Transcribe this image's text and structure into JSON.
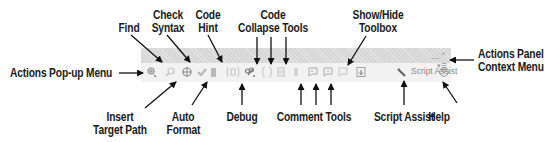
{
  "toolbar": {
    "buttons": [
      {
        "id": "actions-popup",
        "icon": "add-actions-icon",
        "glyph": "⊕"
      },
      {
        "id": "find",
        "icon": "find-icon",
        "glyph": "⌕"
      },
      {
        "id": "insert-target-path",
        "icon": "target-icon",
        "glyph": "⊕"
      },
      {
        "id": "check-syntax",
        "icon": "checkmark-icon",
        "glyph": "✔"
      },
      {
        "id": "auto-format",
        "icon": "auto-format-icon",
        "glyph": "▮"
      },
      {
        "id": "code-hint",
        "icon": "code-hint-icon",
        "glyph": "(¦)"
      },
      {
        "id": "debug",
        "icon": "debug-icon",
        "glyph": "✎"
      },
      {
        "id": "collapse-between-braces",
        "icon": "collapse-braces-icon",
        "glyph": "{}"
      },
      {
        "id": "collapse-selection",
        "icon": "collapse-selection-icon",
        "glyph": "▯"
      },
      {
        "id": "expand-all",
        "icon": "expand-all-icon",
        "glyph": "✱"
      },
      {
        "id": "apply-block-comment",
        "icon": "block-comment-icon",
        "glyph": "◻"
      },
      {
        "id": "apply-line-comment",
        "icon": "line-comment-icon",
        "glyph": "◻"
      },
      {
        "id": "remove-comment",
        "icon": "remove-comment-icon",
        "glyph": "◻"
      },
      {
        "id": "show-hide-toolbox",
        "icon": "toolbox-icon",
        "glyph": "▣"
      },
      {
        "id": "help",
        "icon": "help-icon",
        "glyph": "?"
      }
    ],
    "script_assist_label": "Script Assist",
    "minimize_glyph": "—",
    "close_glyph": "×",
    "panel_menu_glyph": "▾☰"
  },
  "callouts": {
    "actions_popup_menu": "Actions Pop-up Menu",
    "find": "Find",
    "check_syntax_line1": "Check",
    "check_syntax_line2": "Syntax",
    "code_hint_line1": "Code",
    "code_hint_line2": "Hint",
    "code_collapse_line1": "Code",
    "code_collapse_line2": "Collapse Tools",
    "show_hide_line1": "Show/Hide",
    "show_hide_line2": "Toolbox",
    "actions_panel_line1": "Actions Panel",
    "actions_panel_line2": "Context Menu",
    "insert_target_line1": "Insert",
    "insert_target_line2": "Target Path",
    "auto_format_line1": "Auto",
    "auto_format_line2": "Format",
    "debug": "Debug",
    "comment_tools": "Comment Tools",
    "script_assist": "Script Assist",
    "help": "Help"
  }
}
